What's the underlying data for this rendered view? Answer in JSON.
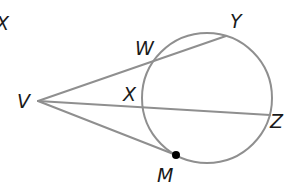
{
  "diagram": {
    "colors": {
      "line": "#8f8f8f",
      "text": "#1a1a1a",
      "point": "#000000",
      "background": "#ffffff"
    },
    "circle": {
      "cx": 207,
      "cy": 98,
      "r": 65
    },
    "points": {
      "V": {
        "x": 38,
        "y": 101
      },
      "W": {
        "x": 155,
        "y": 60
      },
      "Y": {
        "x": 226,
        "y": 36
      },
      "X": {
        "x": 145,
        "y": 107
      },
      "Z": {
        "x": 268,
        "y": 115
      },
      "M": {
        "x": 176,
        "y": 155
      }
    },
    "segments": [
      {
        "from": "V",
        "to": "Y",
        "type": "secant"
      },
      {
        "from": "V",
        "to": "Z",
        "type": "secant"
      },
      {
        "from": "V",
        "to": "M",
        "type": "tangent"
      }
    ],
    "labels": {
      "corner": "X",
      "V": "V",
      "W": "W",
      "Y": "Y",
      "X": "X",
      "Z": "Z",
      "M": "M"
    }
  }
}
